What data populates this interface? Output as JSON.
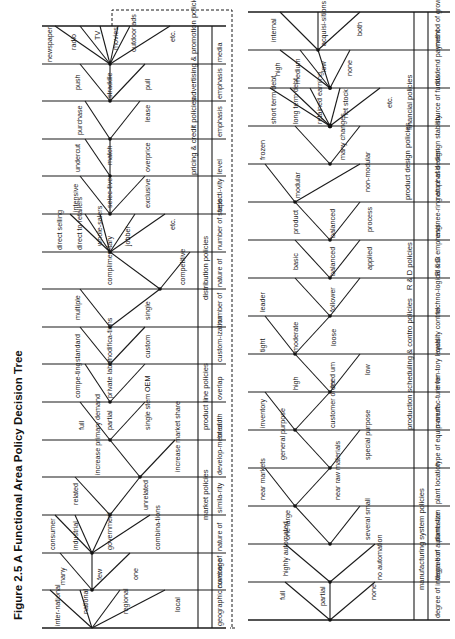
{
  "title": "Figure 2.5  A Functional Area Policy Decision Tree",
  "top_half": {
    "groups": [
      {
        "group": "market policies",
        "decisions": [
          {
            "label": "geographic coverage",
            "options": [
              "inter-national",
              "national",
              "regional",
              "local"
            ]
          },
          {
            "label": "number of",
            "options": [
              "many",
              "few",
              "one"
            ]
          },
          {
            "label": "nature of",
            "options": [
              "consumer",
              "industrial",
              "government",
              "combina-tions"
            ]
          },
          {
            "label": "simila-rity",
            "options": [
              "related",
              "unrelated"
            ]
          },
          {
            "label": "develop-ment of",
            "options": [
              "increase primary demand",
              "increase market share"
            ]
          }
        ]
      },
      {
        "group": "product line policies",
        "decisions": [
          {
            "label": "breadth",
            "options": [
              "full",
              "partial",
              "single stem"
            ]
          },
          {
            "label": "overlap",
            "options": [
              "compe-ting",
              "private label",
              "OEM"
            ]
          },
          {
            "label": "custom-ization",
            "options": [
              "standard",
              "modifica-tions",
              "custom"
            ]
          }
        ]
      },
      {
        "group": "distribution policies",
        "decisions": [
          {
            "label": "number of",
            "options": [
              "multiple",
              "single"
            ]
          },
          {
            "label": "nature of",
            "options": [
              "complimen-tary",
              "competitive"
            ]
          },
          {
            "label": "number of steps",
            "options": [
              "direct selling",
              "direct to retailers",
              "whole-salers",
              "jobber",
              "etc."
            ]
          },
          {
            "label": "selecti-vity",
            "options": [
              "intensive",
              "selec-tive",
              "exclusive"
            ]
          }
        ]
      },
      {
        "group": "pricing & credit policies",
        "decisions": [
          {
            "label": "level",
            "options": [
              "undercut",
              "match",
              "overprice"
            ]
          },
          {
            "label": "emphasis",
            "options": [
              "purchase",
              "lease"
            ]
          }
        ]
      },
      {
        "group": "advertising & promotion policies",
        "decisions": [
          {
            "label": "emphasis",
            "options": [
              "push",
              "straddle",
              "pull"
            ]
          },
          {
            "label": "media",
            "options": [
              "newspaper",
              "radio",
              "TV",
              "movies",
              "outdoor ads",
              "etc."
            ]
          }
        ]
      }
    ]
  },
  "bottom_half": {
    "groups": [
      {
        "group": "manufacturing system policies",
        "decisions": [
          {
            "label": "degree of integra-tion",
            "options": [
              "full",
              "partial",
              "none"
            ]
          },
          {
            "label": "degree of automa-tion",
            "options": [
              "highly automated",
              "no automation"
            ]
          },
          {
            "label": "plant size",
            "options": [
              "one large",
              "several small"
            ]
          },
          {
            "label": "plant location",
            "options": [
              "near markets",
              "near raw materials"
            ]
          },
          {
            "label": "type of equip-ment",
            "options": [
              "general purpose",
              "special purpose"
            ]
          }
        ]
      },
      {
        "group": "production scheduling & contro policies",
        "decisions": [
          {
            "label": "manufac-ture for",
            "options": [
              "inventory",
              "customer order"
            ]
          },
          {
            "label": "inven-tory levels",
            "options": [
              "high",
              "med um",
              "low"
            ]
          },
          {
            "label": "quality control",
            "options": [
              "tight",
              "moderate",
              "loose"
            ]
          }
        ]
      },
      {
        "group": "R & D policies",
        "decisions": [
          {
            "label": "techno-logical risk",
            "options": [
              "leader",
              "follower"
            ]
          },
          {
            "label": "R & D emphasis",
            "options": [
              "basic",
              "balanced",
              "applied"
            ]
          },
          {
            "label": "enginee-ring emphasis",
            "options": [
              "product",
              "balanced",
              "process"
            ]
          }
        ]
      },
      {
        "group": "product design policies",
        "decisions": [
          {
            "label": "nature of design",
            "options": [
              "modular",
              "non-modular"
            ]
          },
          {
            "label": "design stability",
            "options": [
              "frozen",
              "many changes"
            ]
          }
        ]
      },
      {
        "group": "financial policies",
        "decisions": [
          {
            "label": "source of funds",
            "options": [
              "short term debt",
              "long term debt",
              "retained earning",
              "net stock",
              "etc."
            ]
          },
          {
            "label": "dividend payment",
            "options": [
              "high",
              "medium",
              "low",
              "none"
            ]
          },
          {
            "label": "method of growth",
            "options": [
              "internal",
              "acquisi-sitions",
              "both"
            ]
          }
        ]
      }
    ]
  }
}
